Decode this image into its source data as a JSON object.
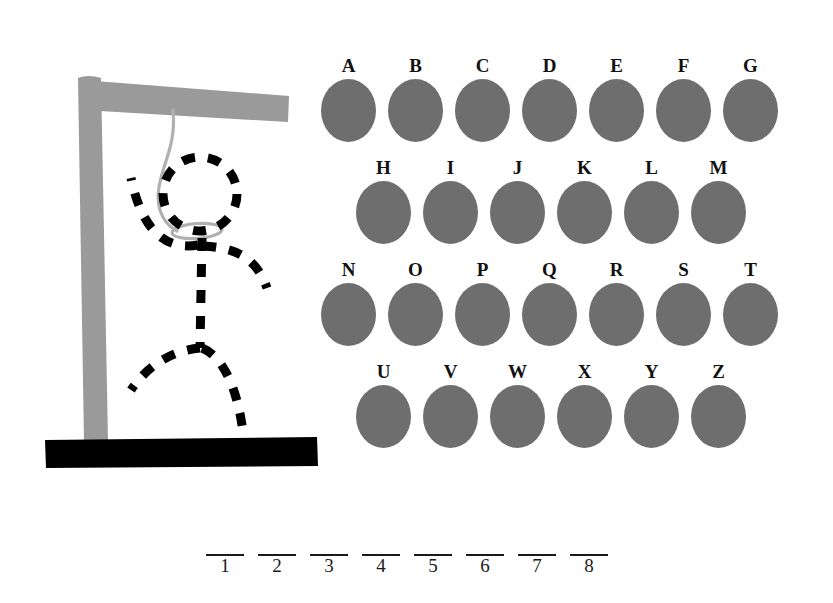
{
  "page": {
    "background_color": "#ffffff"
  },
  "colors": {
    "gallows": "#9a9a9a",
    "base": "#000000",
    "rope": "#b0b0b0",
    "figure": "#000000",
    "key_disc": "#6e6e6e",
    "text": "#111111"
  },
  "gallows": {
    "name": "hangman-gallows",
    "post_color": "#9a9a9a",
    "crossbar_color": "#9a9a9a",
    "base_color": "#000000",
    "rope_color": "#b0b0b0"
  },
  "figure": {
    "name": "hangman-figure",
    "style": "dashed",
    "color": "#000000",
    "parts": [
      "head",
      "neck-noose",
      "torso",
      "left-arm",
      "right-arm",
      "left-leg",
      "right-leg"
    ],
    "parts_drawn": 7
  },
  "keyboard": {
    "label": "letter-keyboard",
    "rows": [
      {
        "letters": [
          "A",
          "B",
          "C",
          "D",
          "E",
          "F",
          "G"
        ]
      },
      {
        "letters": [
          "H",
          "I",
          "J",
          "K",
          "L",
          "M"
        ]
      },
      {
        "letters": [
          "N",
          "O",
          "P",
          "Q",
          "R",
          "S",
          "T"
        ]
      },
      {
        "letters": [
          "U",
          "V",
          "W",
          "X",
          "Y",
          "Z"
        ]
      }
    ]
  },
  "answer": {
    "label": "answer-blanks",
    "length": 8,
    "slots": [
      {
        "index": "1",
        "letter": ""
      },
      {
        "index": "2",
        "letter": ""
      },
      {
        "index": "3",
        "letter": ""
      },
      {
        "index": "4",
        "letter": ""
      },
      {
        "index": "5",
        "letter": ""
      },
      {
        "index": "6",
        "letter": ""
      },
      {
        "index": "7",
        "letter": ""
      },
      {
        "index": "8",
        "letter": ""
      }
    ]
  }
}
